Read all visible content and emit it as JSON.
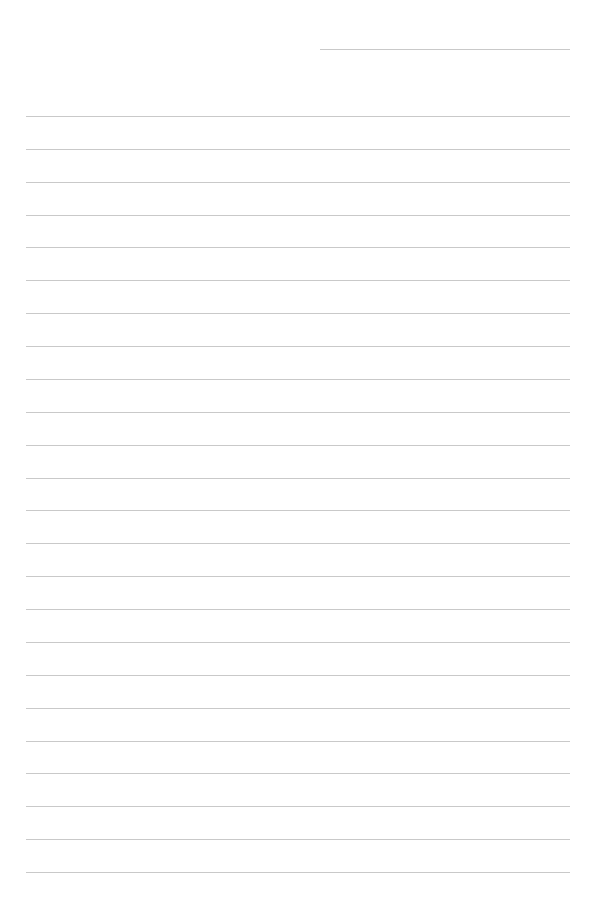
{
  "page": {
    "type": "lined-paper",
    "background": "#ffffff",
    "line_color": "#c9c9c9",
    "header_line": {
      "x_start": 320,
      "x_end": 570,
      "y": 49
    },
    "ruled_lines": {
      "count": 24,
      "x_start": 26,
      "x_end": 570,
      "first_y": 116,
      "spacing": 32.87
    }
  }
}
